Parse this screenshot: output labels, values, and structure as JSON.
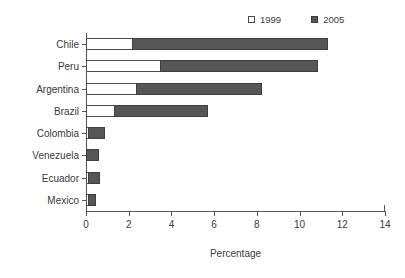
{
  "chart_data": {
    "type": "bar",
    "orientation": "horizontal",
    "stacked": true,
    "title": "",
    "xlabel": "Percentage",
    "ylabel": "",
    "xlim": [
      0,
      14
    ],
    "xticks": [
      "0",
      "2",
      "4",
      "6",
      "8",
      "10",
      "12",
      "14"
    ],
    "xtick_values": [
      0,
      2,
      4,
      6,
      8,
      10,
      12,
      14
    ],
    "grid": false,
    "legend_position": "top-right",
    "categories": [
      "Chile",
      "Peru",
      "Argentina",
      "Brazil",
      "Colombia",
      "Venezuela",
      "Ecuador",
      "Mexico"
    ],
    "series": [
      {
        "name": "1999",
        "color": "#ffffff",
        "values": [
          2.2,
          3.5,
          2.4,
          1.35,
          0.05,
          0.0,
          0.15,
          0.15
        ]
      },
      {
        "name": "2005",
        "color": "#565656",
        "values": [
          9.2,
          7.4,
          5.9,
          4.4,
          0.8,
          0.6,
          0.55,
          0.35
        ]
      }
    ],
    "totals": [
      11.4,
      10.9,
      8.3,
      5.75,
      0.85,
      0.6,
      0.7,
      0.5
    ]
  },
  "legend": {
    "entries": [
      {
        "label": "1999",
        "swatch": "open-square"
      },
      {
        "label": "2005",
        "swatch": "filled-square"
      }
    ]
  },
  "axis": {
    "x_title": "Percentage"
  }
}
